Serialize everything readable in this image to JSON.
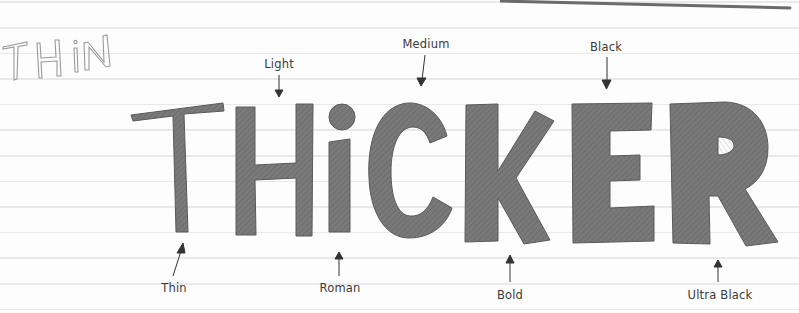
{
  "title_small": "THIN",
  "title_large": "THiCKER",
  "letters": [
    "T",
    "H",
    "i",
    "C",
    "K",
    "E",
    "R"
  ],
  "weights": {
    "top": [
      {
        "label": "Light",
        "x": 279,
        "y": 64
      },
      {
        "label": "Medium",
        "x": 426,
        "y": 44
      },
      {
        "label": "Black",
        "x": 606,
        "y": 47
      }
    ],
    "bottom": [
      {
        "label": "Thin",
        "x": 174,
        "y": 288
      },
      {
        "label": "Roman",
        "x": 340,
        "y": 288
      },
      {
        "label": "Bold",
        "x": 510,
        "y": 295
      },
      {
        "label": "Ultra Black",
        "x": 720,
        "y": 295
      }
    ]
  },
  "colors": {
    "paper": "#fdfdfd",
    "rule_line": "#e9e9e9",
    "letter_fill": "#737373",
    "letter_stroke": "#555555",
    "outline_text": "#9a9a9a",
    "label_text": "#3a3a3a",
    "arrow": "#333333"
  }
}
